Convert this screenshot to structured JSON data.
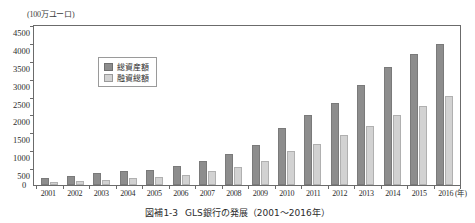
{
  "figure": {
    "unit_label": "(100万ユーロ)",
    "x_axis_unit": "(年)",
    "zero_label": "0",
    "caption_number": "図補1-3",
    "caption_text": "GLS銀行の発展（2001～2016年）"
  },
  "legend": {
    "items": [
      {
        "label": "総資産額",
        "color": "#8d8d8d"
      },
      {
        "label": "融資総額",
        "color": "#d2d2d2"
      }
    ]
  },
  "chart_data": {
    "type": "bar",
    "title": "GLS銀行の発展（2001～2016年）",
    "xlabel": "(年)",
    "ylabel": "(100万ユーロ)",
    "ylim": [
      0,
      4500
    ],
    "yticks": [
      0,
      500,
      1000,
      1500,
      2000,
      2500,
      3000,
      3500,
      4000,
      4500
    ],
    "ytick_labels": [
      "0",
      "500",
      "1000",
      "1500",
      "2000",
      "2500",
      "3000",
      "3500",
      "4000",
      "4500"
    ],
    "grid": false,
    "legend_position": "upper-left-inside",
    "categories": [
      "2001",
      "2002",
      "2003",
      "2004",
      "2005",
      "2006",
      "2007",
      "2008",
      "2009",
      "2010",
      "2011",
      "2012",
      "2013",
      "2014",
      "2015",
      "2016"
    ],
    "series": [
      {
        "name": "総資産額",
        "color": "#8d8d8d",
        "values": [
          200,
          240,
          330,
          380,
          430,
          530,
          680,
          860,
          1130,
          1600,
          1950,
          2300,
          2800,
          3300,
          3650,
          3950
        ]
      },
      {
        "name": "融資総額",
        "color": "#d2d2d2",
        "values": [
          90,
          110,
          150,
          190,
          230,
          290,
          390,
          500,
          680,
          950,
          1150,
          1400,
          1650,
          1950,
          2200,
          2500
        ]
      }
    ]
  }
}
